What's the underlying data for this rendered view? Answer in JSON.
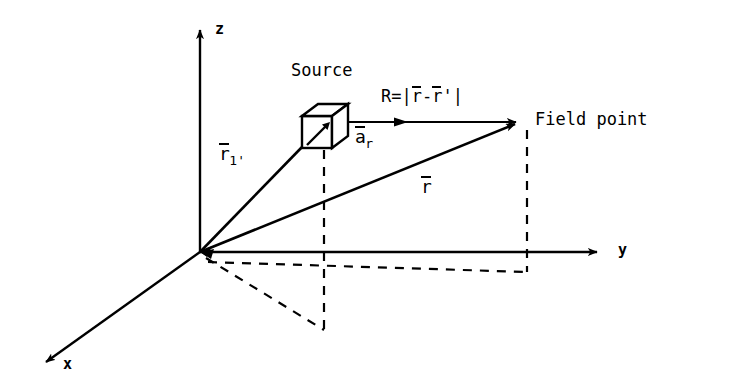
{
  "figure": {
    "background_color": "#ffffff",
    "stroke_color": "#000000"
  },
  "axes": {
    "z_label": "z",
    "y_label": "y",
    "x_label": "x"
  },
  "labels": {
    "source": "Source",
    "field_point": "Field point",
    "distance_formula": {
      "prefix": "R=",
      "open_bar": "|",
      "r_vector": "r",
      "minus": "-",
      "r_prime_vector": "r",
      "prime": "'",
      "close_bar": "|"
    },
    "unit_vector": {
      "base": "a",
      "subscript": "r"
    },
    "position_vector_source": {
      "base": "r",
      "subscript": "1'"
    },
    "position_vector_field": {
      "base": "r"
    }
  },
  "geometry": {
    "origin": [
      200,
      252
    ],
    "z_axis_tip": [
      200,
      25
    ],
    "y_axis_tip": [
      600,
      252
    ],
    "x_axis_tip": [
      42,
      365
    ],
    "source_cube_anchor": [
      300,
      148
    ],
    "field_point": [
      519,
      122
    ]
  }
}
